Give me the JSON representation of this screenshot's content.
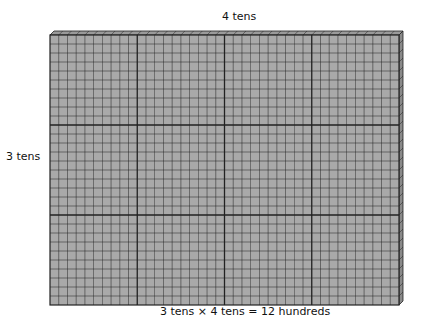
{
  "diagram": {
    "title_top": "4 tens",
    "label_side": "3 tens",
    "caption": "3 tens × 4 tens = 12 hundreds",
    "grid": {
      "columns": 40,
      "rows": 30,
      "major_every": 10,
      "fill_color": "#a9a9a9",
      "line_color": "#222222"
    }
  }
}
